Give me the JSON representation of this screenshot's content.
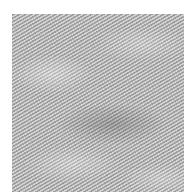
{
  "image": {
    "subject": "grayscale diagonal twill fabric texture",
    "alt": "Close-up of gray woven fabric with diagonal twill weave"
  },
  "colors": {
    "background": "#ffffff",
    "texture_base": "#b4b4b4"
  }
}
